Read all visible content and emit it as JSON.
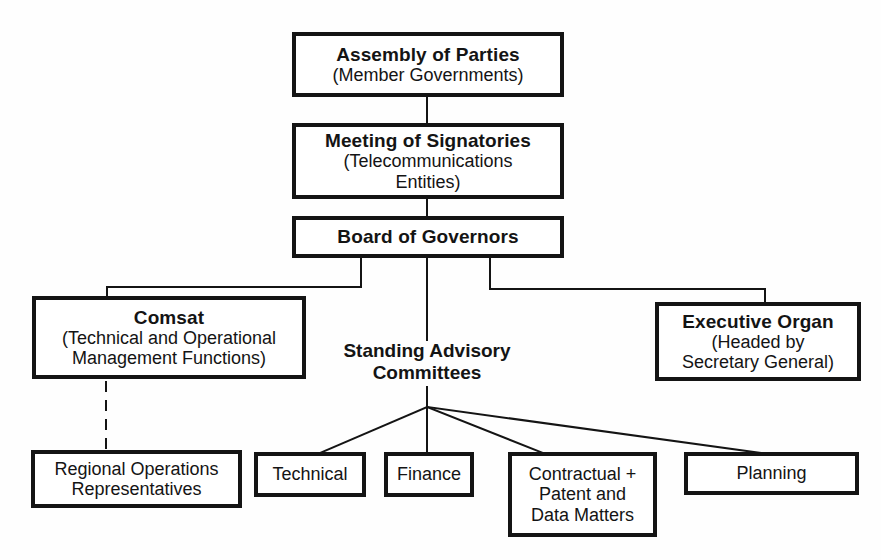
{
  "diagram": {
    "type": "organization-chart",
    "colors": {
      "line": "#141414",
      "box_border": "#141414",
      "background": "#fefefe"
    },
    "nodes": {
      "assembly": {
        "title": "Assembly of Parties",
        "subtitle": "(Member Governments)"
      },
      "signatories": {
        "title": "Meeting of Signatories",
        "subtitle": "(Telecommunications\nEntities)"
      },
      "board": {
        "title": "Board of Governors"
      },
      "comsat": {
        "title": "Comsat",
        "subtitle": "(Technical and Operational\nManagement Functions)"
      },
      "committees": {
        "title": "Standing Advisory\nCommittees"
      },
      "executive": {
        "title": "Executive Organ",
        "subtitle": "(Headed by\nSecretary General)"
      },
      "regional": {
        "subtitle": "Regional Operations\nRepresentatives"
      },
      "technical": {
        "subtitle": "Technical"
      },
      "finance": {
        "subtitle": "Finance"
      },
      "contractual": {
        "subtitle": "Contractual +\nPatent and\nData Matters"
      },
      "planning": {
        "subtitle": "Planning"
      }
    },
    "edges": [
      {
        "from": "Assembly of Parties",
        "to": "Meeting of Signatories",
        "style": "solid"
      },
      {
        "from": "Meeting of Signatories",
        "to": "Board of Governors",
        "style": "solid"
      },
      {
        "from": "Board of Governors",
        "to": "Comsat",
        "style": "solid"
      },
      {
        "from": "Board of Governors",
        "to": "Standing Advisory Committees",
        "style": "solid"
      },
      {
        "from": "Board of Governors",
        "to": "Executive Organ",
        "style": "solid"
      },
      {
        "from": "Comsat",
        "to": "Regional Operations Representatives",
        "style": "dashed"
      },
      {
        "from": "Standing Advisory Committees",
        "to": "Technical",
        "style": "solid"
      },
      {
        "from": "Standing Advisory Committees",
        "to": "Finance",
        "style": "solid"
      },
      {
        "from": "Standing Advisory Committees",
        "to": "Contractual + Patent and Data Matters",
        "style": "solid"
      },
      {
        "from": "Standing Advisory Committees",
        "to": "Planning",
        "style": "solid"
      }
    ]
  }
}
